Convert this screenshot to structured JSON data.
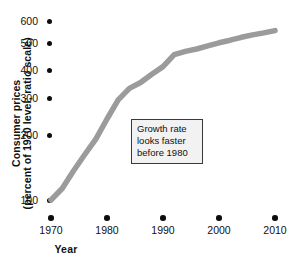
{
  "chart_data": {
    "type": "line",
    "title": "",
    "xlabel": "Year",
    "ylabel_line1": "Consumer prices",
    "ylabel_line2": "(percent of 1970 level; ratio scale)",
    "scale": "log",
    "grid": false,
    "legend": "none",
    "xlim": [
      1968,
      2012
    ],
    "ylim": [
      90,
      660
    ],
    "x_ticks": [
      1970,
      1980,
      1990,
      2000,
      2010
    ],
    "x_tick_labels": [
      "1970",
      "1980",
      "1990",
      "2000",
      "2010"
    ],
    "y_ticks": [
      100,
      200,
      300,
      400,
      500,
      600
    ],
    "y_tick_labels": [
      "100",
      "200",
      "300",
      "400",
      "500",
      "600"
    ],
    "series": [
      {
        "name": "Consumer prices",
        "color": "#9b9b9b",
        "x": [
          1970,
          1972,
          1974,
          1976,
          1978,
          1980,
          1982,
          1984,
          1986,
          1988,
          1990,
          1992,
          1994,
          1996,
          1998,
          2000,
          2002,
          2004,
          2006,
          2008,
          2010
        ],
        "values": [
          100,
          112,
          133,
          156,
          182,
          222,
          268,
          300,
          318,
          345,
          372,
          418,
          432,
          442,
          456,
          470,
          482,
          496,
          508,
          518,
          530
        ]
      }
    ],
    "annotations": [
      {
        "name": "growth-rate-callout",
        "lines": [
          "Growth rate",
          "looks faster",
          "before 1980"
        ]
      }
    ]
  },
  "bottom_caption": ""
}
